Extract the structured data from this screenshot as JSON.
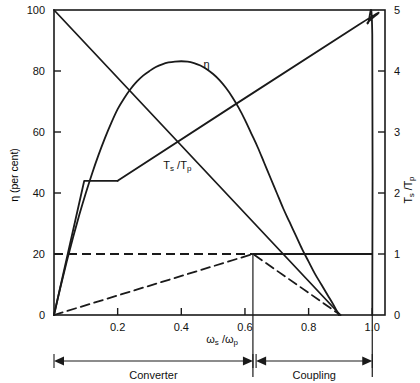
{
  "chart_data": {
    "type": "line",
    "title": "",
    "xlabel": "ωs /ωp",
    "xlabel_parts": {
      "omega": "ω",
      "sub_s": "s",
      "slash": "/",
      "omega2": "ω",
      "sub_p": "p"
    },
    "ylabel_left": "η (per cent)",
    "ylabel_right": "Ts /Tp",
    "xlim": [
      0,
      1.04
    ],
    "ylim_left": [
      0,
      100
    ],
    "ylim_right": [
      0,
      5
    ],
    "grid": false,
    "legend": "inline-annotations",
    "xticks": [
      0.2,
      0.4,
      0.6,
      0.8,
      1.0
    ],
    "xtick_labels": [
      "0.2",
      "0.4",
      "0.6",
      "0.8",
      "1.0"
    ],
    "yticks_left": [
      0,
      20,
      40,
      60,
      80,
      100
    ],
    "ytick_labels_left": [
      "0",
      "20",
      "40",
      "60",
      "80",
      "100"
    ],
    "yticks_right": [
      0,
      1,
      2,
      3,
      4,
      5
    ],
    "ytick_labels_right": [
      "0",
      "1",
      "2",
      "3",
      "4",
      "5"
    ],
    "series": [
      {
        "name": "η",
        "axis": "left",
        "style": "solid",
        "label": "η",
        "label_at": [
          0.47,
          81
        ],
        "points": [
          [
            0.0,
            0.0
          ],
          [
            0.02,
            9.0
          ],
          [
            0.04,
            17.5
          ],
          [
            0.06,
            25.5
          ],
          [
            0.08,
            33.0
          ],
          [
            0.1,
            40.0
          ],
          [
            0.12,
            46.5
          ],
          [
            0.14,
            52.5
          ],
          [
            0.16,
            58.0
          ],
          [
            0.18,
            63.0
          ],
          [
            0.2,
            67.5
          ],
          [
            0.22,
            71.0
          ],
          [
            0.24,
            74.0
          ],
          [
            0.26,
            76.5
          ],
          [
            0.28,
            78.5
          ],
          [
            0.3,
            80.0
          ],
          [
            0.32,
            81.3
          ],
          [
            0.34,
            82.2
          ],
          [
            0.36,
            82.8
          ],
          [
            0.38,
            83.1
          ],
          [
            0.4,
            83.2
          ],
          [
            0.42,
            83.1
          ],
          [
            0.44,
            82.6
          ],
          [
            0.46,
            81.8
          ],
          [
            0.48,
            80.6
          ],
          [
            0.5,
            79.0
          ],
          [
            0.52,
            77.0
          ],
          [
            0.54,
            74.5
          ],
          [
            0.56,
            71.5
          ],
          [
            0.58,
            68.0
          ],
          [
            0.6,
            64.0
          ],
          [
            0.62,
            59.5
          ],
          [
            0.64,
            55.0
          ],
          [
            0.66,
            50.0
          ],
          [
            0.68,
            45.0
          ],
          [
            0.7,
            40.0
          ],
          [
            0.72,
            35.0
          ],
          [
            0.74,
            30.5
          ],
          [
            0.76,
            26.0
          ],
          [
            0.78,
            21.5
          ],
          [
            0.8,
            17.5
          ],
          [
            0.82,
            13.5
          ],
          [
            0.84,
            10.0
          ],
          [
            0.86,
            6.5
          ],
          [
            0.88,
            3.0
          ],
          [
            0.895,
            0.0
          ]
        ]
      },
      {
        "name": "Ts /Tp (converter, solid)",
        "axis": "right",
        "style": "solid",
        "label": "Ts /Tp",
        "label_at": [
          0.4,
          48
        ],
        "points": [
          [
            0.0,
            5.0
          ],
          [
            0.9,
            0.0
          ]
        ]
      },
      {
        "name": "Ts /Tp (torque, rising solid)",
        "axis": "right",
        "style": "solid",
        "label": "",
        "points": [
          [
            0.0,
            0.0
          ],
          [
            0.095,
            2.2
          ],
          [
            0.2,
            2.2
          ]
        ]
      },
      {
        "name": "Ts /Tp (coupling ratio, dashed)",
        "axis": "right",
        "style": "dashed",
        "label": "",
        "points": [
          [
            0.0,
            0.0
          ],
          [
            0.625,
            1.0
          ],
          [
            0.9,
            0.0
          ]
        ]
      },
      {
        "name": "Ts /Tp = 1 line (dashed then solid)",
        "axis": "right",
        "style": "dashed-solid",
        "label": "",
        "points": [
          [
            0.0,
            1.0
          ],
          [
            1.0,
            1.0
          ]
        ]
      },
      {
        "name": "torque rise to lock-up",
        "axis": "right",
        "style": "solid",
        "label": "",
        "points": [
          [
            0.2,
            2.2
          ],
          [
            0.955,
            4.75
          ],
          [
            0.985,
            4.78
          ],
          [
            1.0,
            4.6
          ],
          [
            1.0,
            0.0
          ]
        ]
      }
    ],
    "annotations": [
      {
        "name": "divider-line",
        "type": "vline",
        "x": 0.625
      },
      {
        "name": "region-converter",
        "type": "span",
        "label": "Converter",
        "from": 0.0,
        "to": 0.625
      },
      {
        "name": "region-coupling",
        "type": "span",
        "label": "Coupling",
        "from": 0.635,
        "to": 1.0
      }
    ]
  },
  "labels": {
    "y_left_axis_title": "η (per cent)",
    "y_right_axis_title": "Ts /Tp",
    "x_axis_title": "ωs /ωp",
    "eta_curve": "η",
    "ts_tp_curve": "Ts /Tp",
    "region_converter": "Converter",
    "region_coupling": "Coupling",
    "x_ticks": [
      "0.2",
      "0.4",
      "0.6",
      "0.8",
      "1.0"
    ],
    "y_left_ticks": [
      "0",
      "20",
      "40",
      "60",
      "80",
      "100"
    ],
    "y_right_ticks": [
      "0",
      "1",
      "2",
      "3",
      "4",
      "5"
    ]
  },
  "colors": {
    "ink": "#1a1a1a",
    "background": "#ffffff",
    "axis": "#2b2b2b"
  }
}
